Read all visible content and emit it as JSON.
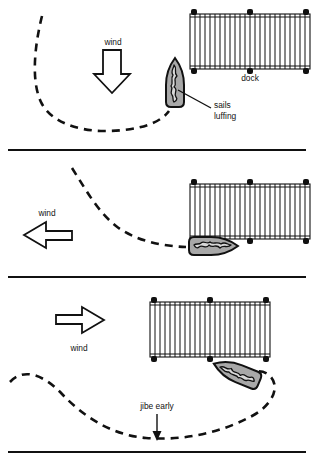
{
  "figure": {
    "width": 314,
    "height": 465,
    "background_color": "#ffffff",
    "ink_color": "#111111",
    "hull_fill_color": "#a8a8a8",
    "sail_fill_color": "#d8d8d8"
  },
  "panels": [
    {
      "id": "panel-1",
      "index": 1,
      "wind_direction": "down",
      "wind_label": "wind",
      "dock_label": "dock",
      "callout_label_line1": "sails",
      "callout_label_line2": "luffing",
      "boat_orientation": "bow-up",
      "boat_rotation_deg": 0
    },
    {
      "id": "panel-2",
      "index": 2,
      "wind_direction": "left",
      "wind_label": "wind",
      "dock_label": "",
      "boat_orientation": "bow-right",
      "boat_rotation_deg": 90
    },
    {
      "id": "panel-3",
      "index": 3,
      "wind_direction": "right",
      "wind_label": "wind",
      "dock_label": "",
      "annotation_label": "jibe early",
      "boat_orientation": "bow-up-left",
      "boat_rotation_deg": -68
    }
  ]
}
